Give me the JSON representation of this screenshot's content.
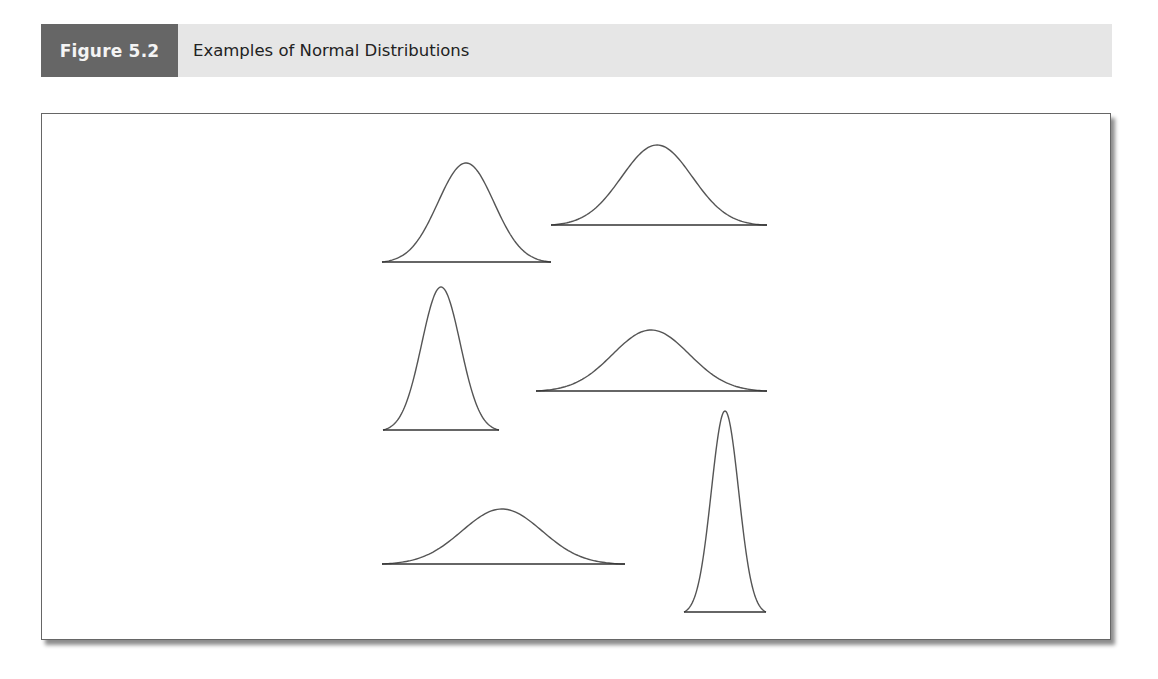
{
  "figure": {
    "label": "Figure 5.2",
    "title": "Examples of Normal Distributions"
  },
  "colors": {
    "label_bg": "#666666",
    "header_bg": "#e6e6e6",
    "curve": "#555555"
  },
  "chart_data": {
    "type": "line",
    "title": "Examples of Normal Distributions",
    "xlabel": "",
    "ylabel": "",
    "grid": false,
    "legend": "none",
    "series": [
      {
        "name": "curve-1",
        "relative_spread": "medium",
        "relative_height": "tall"
      },
      {
        "name": "curve-2",
        "relative_spread": "wide",
        "relative_height": "medium"
      },
      {
        "name": "curve-3",
        "relative_spread": "narrow",
        "relative_height": "tall"
      },
      {
        "name": "curve-4",
        "relative_spread": "wide",
        "relative_height": "short"
      },
      {
        "name": "curve-5",
        "relative_spread": "widest",
        "relative_height": "shortest"
      },
      {
        "name": "curve-6",
        "relative_spread": "narrowest",
        "relative_height": "tallest"
      }
    ]
  }
}
